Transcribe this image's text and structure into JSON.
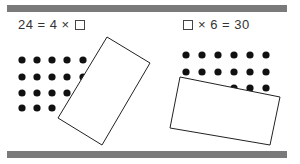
{
  "problems": [
    {
      "id": "left",
      "equation": {
        "before": "24 = 4 ×",
        "after": "",
        "blank_position": "end"
      },
      "dot_array": {
        "rows": 4,
        "columns_visible": 5
      },
      "card": "tilted-rectangle-covering-dots"
    },
    {
      "id": "right",
      "equation": {
        "before": "",
        "after": "× 6 = 30",
        "blank_position": "start"
      },
      "dot_array": {
        "rows": 3,
        "columns_visible": 6
      },
      "card": "tilted-rectangle-covering-dots"
    }
  ],
  "colors": {
    "bar": "#7a7a7a",
    "dot": "#111111",
    "card_stroke": "#222222",
    "text": "#333333"
  }
}
